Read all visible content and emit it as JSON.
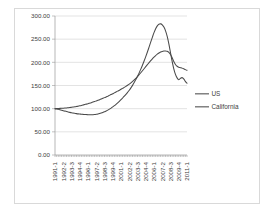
{
  "chart_data": {
    "type": "line",
    "title": "",
    "xlabel": "",
    "ylabel": "",
    "ylim": [
      0,
      300
    ],
    "ytick_labels": [
      "0.00",
      "50.00",
      "100.00",
      "150.00",
      "200.00",
      "250.00",
      "300.00"
    ],
    "ytick_values": [
      0,
      50,
      100,
      150,
      200,
      250,
      300
    ],
    "grid": true,
    "legend_position": "right",
    "x": [
      "1991-1",
      "1991-2",
      "1991-3",
      "1991-4",
      "1992-1",
      "1992-2",
      "1992-3",
      "1992-4",
      "1993-1",
      "1993-2",
      "1993-3",
      "1993-4",
      "1994-1",
      "1994-2",
      "1994-3",
      "1994-4",
      "1995-1",
      "1995-2",
      "1995-3",
      "1995-4",
      "1996-1",
      "1996-2",
      "1996-3",
      "1996-4",
      "1997-1",
      "1997-2",
      "1997-3",
      "1997-4",
      "1998-1",
      "1998-2",
      "1998-3",
      "1998-4",
      "1999-1",
      "1999-2",
      "1999-3",
      "1999-4",
      "2000-1",
      "2000-2",
      "2000-3",
      "2000-4",
      "2001-1",
      "2001-2",
      "2001-3",
      "2001-4",
      "2002-1",
      "2002-2",
      "2002-3",
      "2002-4",
      "2003-1",
      "2003-2",
      "2003-3",
      "2003-4",
      "2004-1",
      "2004-2",
      "2004-3",
      "2004-4",
      "2005-1",
      "2005-2",
      "2005-3",
      "2005-4",
      "2006-1",
      "2006-2",
      "2006-3",
      "2006-4",
      "2007-1",
      "2007-2",
      "2007-3",
      "2007-4",
      "2008-1",
      "2008-2",
      "2008-3",
      "2008-4",
      "2009-1",
      "2009-2",
      "2009-3",
      "2009-4",
      "2010-1",
      "2010-2",
      "2010-3",
      "2010-4",
      "2011-1"
    ],
    "xtick_labels": [
      "1991-1",
      "1992-2",
      "1993-3",
      "1994-4",
      "1996-1",
      "1997-2",
      "1998-3",
      "1999-4",
      "2001-1",
      "2002-2",
      "2003-3",
      "2004-4",
      "2006-1",
      "2007-2",
      "2008-3",
      "2009-4",
      "2011-1"
    ],
    "xtick_indices": [
      0,
      5,
      10,
      15,
      20,
      25,
      30,
      35,
      40,
      45,
      50,
      55,
      60,
      65,
      70,
      75,
      80
    ],
    "series": [
      {
        "name": "US",
        "color": "#4a4a4a",
        "values": [
          100.0,
          100.2,
          100.4,
          100.6,
          100.8,
          101.0,
          101.3,
          101.6,
          102.0,
          102.4,
          102.9,
          103.4,
          104.0,
          104.7,
          105.4,
          106.2,
          107.0,
          107.9,
          108.8,
          109.8,
          110.8,
          111.9,
          113.0,
          114.2,
          115.4,
          116.7,
          118.0,
          119.4,
          120.8,
          122.3,
          123.8,
          125.4,
          127.0,
          128.7,
          130.4,
          132.2,
          134.0,
          135.9,
          137.8,
          139.8,
          141.8,
          143.9,
          146.0,
          148.2,
          150.5,
          153.0,
          155.8,
          158.8,
          162.0,
          165.5,
          169.3,
          173.3,
          177.5,
          181.8,
          186.2,
          190.6,
          195.0,
          199.4,
          203.6,
          207.6,
          211.3,
          214.7,
          217.7,
          220.2,
          222.2,
          223.6,
          224.4,
          224.6,
          223.8,
          221.5,
          217.0,
          210.0,
          202.0,
          195.5,
          191.5,
          189.5,
          188.5,
          187.5,
          186.0,
          184.3,
          182.8
        ]
      },
      {
        "name": "California",
        "color": "#4a4a4a",
        "values": [
          100.0,
          99.4,
          98.6,
          97.7,
          96.7,
          95.7,
          94.7,
          93.7,
          92.8,
          92.0,
          91.2,
          90.5,
          89.9,
          89.3,
          88.8,
          88.4,
          88.0,
          87.7,
          87.4,
          87.2,
          87.0,
          86.9,
          86.9,
          87.0,
          87.3,
          87.8,
          88.5,
          89.4,
          90.5,
          91.8,
          93.3,
          95.0,
          96.9,
          99.0,
          101.3,
          103.8,
          106.5,
          109.4,
          112.5,
          115.8,
          119.3,
          123.0,
          126.9,
          131.0,
          135.3,
          139.8,
          144.8,
          150.3,
          156.3,
          162.8,
          169.8,
          177.3,
          185.3,
          193.8,
          202.8,
          212.3,
          222.3,
          232.8,
          243.5,
          254.0,
          264.0,
          272.5,
          278.8,
          282.3,
          283.0,
          281.0,
          276.0,
          268.0,
          256.0,
          240.0,
          221.0,
          202.0,
          186.0,
          174.0,
          166.5,
          162.5,
          165.5,
          167.0,
          164.5,
          159.0,
          154.8
        ]
      }
    ]
  },
  "legend": {
    "entries": [
      {
        "label": "US"
      },
      {
        "label": "California"
      }
    ]
  }
}
